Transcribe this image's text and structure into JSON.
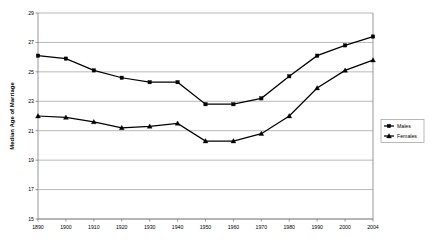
{
  "chart_data": {
    "type": "line",
    "title": "",
    "xlabel": "",
    "ylabel": "Median Age of Marriage",
    "categories": [
      "1890",
      "1900",
      "1910",
      "1920",
      "1930",
      "1940",
      "1950",
      "1960",
      "1970",
      "1980",
      "1990",
      "2000",
      "2004"
    ],
    "ylim": [
      15,
      29
    ],
    "ytick_step": 2,
    "yticks": [
      "15",
      "17",
      "19",
      "21",
      "23",
      "25",
      "27",
      "29"
    ],
    "grid": "horizontal",
    "legend_position": "right",
    "series": [
      {
        "name": "Males",
        "marker": "square",
        "color": "#000000",
        "values": [
          26.1,
          25.9,
          25.1,
          24.6,
          24.3,
          24.3,
          22.8,
          22.8,
          23.2,
          24.7,
          26.1,
          26.8,
          27.4
        ]
      },
      {
        "name": "Females",
        "marker": "triangle",
        "color": "#000000",
        "values": [
          22.0,
          21.9,
          21.6,
          21.2,
          21.3,
          21.5,
          20.3,
          20.3,
          20.8,
          22.0,
          23.9,
          25.1,
          25.8
        ]
      }
    ]
  },
  "legend": {
    "items": [
      {
        "label": "Males"
      },
      {
        "label": "Females"
      }
    ]
  },
  "axes": {
    "y_title": "Median Age of Marriage"
  }
}
